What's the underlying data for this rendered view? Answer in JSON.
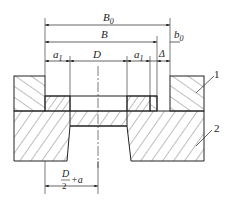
{
  "diagram": {
    "dimensions": {
      "overall_width": "B",
      "overall_width_sub": "0",
      "inner_width": "B",
      "clearance": "b",
      "clearance_sub": "0",
      "left_margin": "a",
      "left_margin_sub": "1",
      "bore": "D",
      "right_margin": "a",
      "right_margin_sub": "1",
      "gap": "Δ",
      "half_bore_numer": "D",
      "half_bore_denom": "2",
      "half_bore_suffix": "+a"
    },
    "part_labels": {
      "part1": "1",
      "part2": "2"
    },
    "colors": {
      "line": "#222222",
      "hatch": "#444444",
      "background": "#ffffff"
    }
  }
}
